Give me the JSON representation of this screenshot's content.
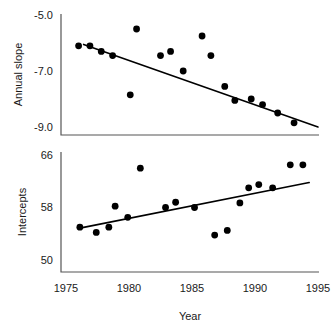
{
  "figure": {
    "xlabel": "Year",
    "panels": [
      {
        "id": "annual-slope",
        "ylabel": "Annual slope",
        "ytick_labels": [
          "-5.0",
          "-7.0",
          "-9.0"
        ],
        "xtick_labels": []
      },
      {
        "id": "intercepts",
        "ylabel": "Intercepts",
        "ytick_labels": [
          "66",
          "58",
          "50"
        ],
        "xtick_labels": [
          "1975",
          "1980",
          "1985",
          "1990",
          "1995"
        ]
      }
    ]
  },
  "chart_data": [
    {
      "type": "scatter",
      "title": "",
      "xlabel": "",
      "ylabel": "Annual slope",
      "xlim": [
        1975,
        1995
      ],
      "ylim": [
        -9.6,
        -4.6
      ],
      "yticks": [
        -5.0,
        -7.0,
        -9.0
      ],
      "xticks": [
        1975,
        1980,
        1985,
        1990,
        1995
      ],
      "grid": false,
      "legend": "none",
      "points": [
        {
          "x": 1976.0,
          "y": -6.1
        },
        {
          "x": 1976.9,
          "y": -6.1
        },
        {
          "x": 1977.8,
          "y": -6.3
        },
        {
          "x": 1978.7,
          "y": -6.45
        },
        {
          "x": 1980.1,
          "y": -7.85
        },
        {
          "x": 1980.6,
          "y": -5.5
        },
        {
          "x": 1982.5,
          "y": -6.45
        },
        {
          "x": 1983.3,
          "y": -6.3
        },
        {
          "x": 1984.3,
          "y": -7.0
        },
        {
          "x": 1985.8,
          "y": -5.75
        },
        {
          "x": 1986.5,
          "y": -6.45
        },
        {
          "x": 1987.6,
          "y": -7.55
        },
        {
          "x": 1988.4,
          "y": -8.05
        },
        {
          "x": 1989.7,
          "y": -8.0
        },
        {
          "x": 1990.6,
          "y": -8.2
        },
        {
          "x": 1991.8,
          "y": -8.5
        },
        {
          "x": 1993.1,
          "y": -8.85
        }
      ],
      "trend_line": {
        "x1": 1976.4,
        "y1": -6.05,
        "x2": 1995.0,
        "y2": -9.0
      }
    },
    {
      "type": "scatter",
      "title": "",
      "xlabel": "Year",
      "ylabel": "Intercepts",
      "xlim": [
        1975,
        1995
      ],
      "ylim": [
        48.6,
        67.2
      ],
      "yticks": [
        66,
        58,
        50
      ],
      "xticks": [
        1975,
        1980,
        1985,
        1990,
        1995
      ],
      "grid": false,
      "legend": "none",
      "points": [
        {
          "x": 1976.1,
          "y": 55.0
        },
        {
          "x": 1977.4,
          "y": 54.2
        },
        {
          "x": 1978.4,
          "y": 55.0
        },
        {
          "x": 1978.9,
          "y": 58.2
        },
        {
          "x": 1979.9,
          "y": 56.5
        },
        {
          "x": 1980.9,
          "y": 64.0
        },
        {
          "x": 1982.9,
          "y": 58.0
        },
        {
          "x": 1983.7,
          "y": 58.8
        },
        {
          "x": 1985.2,
          "y": 58.0
        },
        {
          "x": 1986.8,
          "y": 53.8
        },
        {
          "x": 1987.8,
          "y": 54.5
        },
        {
          "x": 1988.8,
          "y": 58.7
        },
        {
          "x": 1989.5,
          "y": 61.0
        },
        {
          "x": 1990.3,
          "y": 61.5
        },
        {
          "x": 1991.4,
          "y": 61.0
        },
        {
          "x": 1992.8,
          "y": 64.5
        },
        {
          "x": 1993.8,
          "y": 64.5
        }
      ],
      "trend_line": {
        "x1": 1976.2,
        "y1": 54.9,
        "x2": 1994.3,
        "y2": 61.8
      }
    }
  ],
  "style": {
    "marker_color": "#000000",
    "line_color": "#000000",
    "axis_color": "#555555",
    "background": "#ffffff",
    "marker_radius_px": 3.4
  }
}
